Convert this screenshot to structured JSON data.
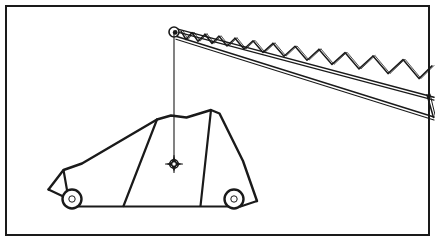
{
  "figure": {
    "title": "Crane lattice boom lifting a car by its center of gravity",
    "caption": "",
    "background_color": "#ffffff",
    "line_color": "#1a1a1a",
    "border": {
      "color": "#1a1a1a",
      "width_px": 2,
      "inset_px": 5
    },
    "canvas": {
      "width": 435,
      "height": 241
    }
  },
  "labels": {
    "boom": "Lattice boom",
    "boom_tip": "Boom tip sheave",
    "hoist_cable": "Hoist cable",
    "cg_marker": "Center of gravity",
    "load": "Car load",
    "front_wheel": "Front wheel",
    "rear_wheel": "Rear wheel"
  },
  "geometry": {
    "boom": {
      "tip": {
        "x": 174,
        "y": 32
      },
      "top_chord": {
        "x1": 177,
        "y1": 30,
        "x2": 434,
        "y2": 99
      },
      "bottom_chord": {
        "x1": 176,
        "y1": 37,
        "x2": 434,
        "y2": 119
      },
      "end_cap": {
        "x1": 428,
        "y1": 97,
        "x2": 434,
        "y2": 119
      },
      "lacing_count": 11,
      "stroke_width": 1.6
    },
    "tip_sheave": {
      "cx": 174,
      "cy": 32,
      "r_outer": 5.0,
      "r_inner": 2.4
    },
    "cable": {
      "x": 174,
      "y_top": 33,
      "y_bottom": 160,
      "stroke_width": 1.1
    },
    "cg": {
      "cx": 174,
      "cy": 164,
      "r_outer": 4.2,
      "r_inner": 1.9,
      "spike_len": 9
    },
    "ground_line": {
      "x1": 72,
      "y1": 206,
      "x2": 234,
      "y2": 206
    },
    "front_wheel": {
      "cx": 72,
      "cy": 199,
      "r_outer": 9.5,
      "r_inner": 3.2
    },
    "rear_wheel": {
      "cx": 234,
      "cy": 199,
      "r_outer": 9.5,
      "r_inner": 3.2
    },
    "body_outline": "M 49,188 L 62,171 L 80,162 L 158,120 L 170,116 L 186,117 L 211,110 L 219,113 L 242,162 L 256,200 L 234,206",
    "body_stroke_width": 2.2
  }
}
